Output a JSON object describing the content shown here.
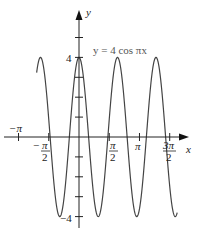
{
  "chart_data": {
    "type": "line",
    "title": "",
    "equation_label": "y = 4 cos πx",
    "xlabel": "x",
    "ylabel": "y",
    "function": "4*cos(pi*x)",
    "xlim": [
      -3.9,
      5.4
    ],
    "ylim": [
      -4.5,
      6.0
    ],
    "x_ticks": [
      {
        "value": -3.14159,
        "label": "−π"
      },
      {
        "value": -1.5708,
        "label": "−π/2"
      },
      {
        "value": 1.5708,
        "label": "π/2"
      },
      {
        "value": 3.14159,
        "label": "π"
      },
      {
        "value": 4.71239,
        "label": "3π/2"
      }
    ],
    "y_ticks": [
      {
        "value": 4,
        "label": "4"
      },
      {
        "value": -4,
        "label": "−4"
      }
    ],
    "y_minor_ticks": [
      -3,
      -2,
      -1,
      1,
      2,
      3,
      5
    ],
    "amplitude": 4,
    "period": 2,
    "grid": false,
    "legend": null,
    "series": [
      {
        "name": "y = 4 cos πx",
        "color": "#444444"
      }
    ]
  },
  "labels": {
    "x_axis": "x",
    "y_axis": "y",
    "equation": "y = 4 cos πx",
    "y_top": "4",
    "y_bottom": "−4",
    "neg_pi": "−π",
    "neg_pi_half_num": "π",
    "pi_half_num": "π",
    "pi": "π",
    "three_pi_half_num": "3π",
    "den": "2",
    "minus": "−"
  }
}
